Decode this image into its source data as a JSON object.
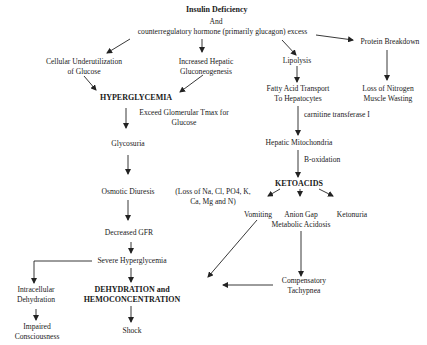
{
  "diagram": {
    "title": "Insulin Deficiency",
    "nodes": {
      "insulin_deficiency": "Insulin Deficiency",
      "and": "And",
      "counterregulatory": "counterregulatory hormone (primarily glucagon) excess",
      "cellular_underutilization_1": "Cellular Underutilization",
      "cellular_underutilization_2": "of Glucose",
      "hepatic_gluconeogenesis_1": "Increased Hepatic",
      "hepatic_gluconeogenesis_2": "Gluconeogenesis",
      "lipolysis": "Lipolysis",
      "protein_breakdown": "Protein Breakdown",
      "hyperglycemia": "HYPERGLYCEMIA",
      "fatty_acid_transport_1": "Fatty Acid Transport",
      "fatty_acid_transport_2": "To Hepatocytes",
      "nitrogen_loss_1": "Loss of Nitrogen",
      "nitrogen_loss_2": "Muscle Wasting",
      "glycosuria": "Glycosuria",
      "hepatic_mitochondria": "Hepatic Mitochondria",
      "osmotic_diuresis": "Osmotic Diuresis",
      "electrolyte_loss_1": "(Loss of Na, Cl, PO4, K,",
      "electrolyte_loss_2": "Ca, Mg and N)",
      "ketoacids": "KETOACIDS",
      "vomiting": "Vomiting",
      "anion_gap_1": "Anion Gap",
      "anion_gap_2": "Metabolic Acidosis",
      "ketonuria": "Ketonuria",
      "decreased_gfr": "Decreased GFR",
      "severe_hyperglycemia": "Severe Hyperglycemia",
      "intracellular_dehydration_1": "Intracellular",
      "intracellular_dehydration_2": "Dehydration",
      "dehydration_1": "DEHYDRATION and",
      "dehydration_2": "HEMOCONCENTRATION",
      "compensatory_tachypnea_1": "Compensatory",
      "compensatory_tachypnea_2": "Tachypnea",
      "impaired_consciousness_1": "Impaired",
      "impaired_consciousness_2": "Consciousness",
      "shock": "Shock"
    },
    "edge_labels": {
      "glomerular_tmax_1": "Exceed Glomerular Tmax for",
      "glomerular_tmax_2": "Glucose",
      "carnitine": "carnitine transferase I",
      "b_oxidation": "B-oxidation"
    },
    "colors": {
      "text": "#1a1a1a",
      "line": "#222222",
      "background": "#ffffff"
    }
  }
}
